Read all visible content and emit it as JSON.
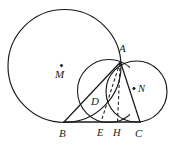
{
  "figure": {
    "background_color": "#ffffff",
    "stroke_color": "#1a1a1a",
    "width": 182,
    "height": 149,
    "labels": {
      "center_m": "M",
      "center_n": "N",
      "point_a": "A",
      "point_b": "B",
      "point_c": "C",
      "point_d": "D",
      "point_e": "E",
      "point_h": "H"
    },
    "label_positions": {
      "center_m": {
        "x": 55,
        "y": 69
      },
      "center_n": {
        "x": 138,
        "y": 84
      },
      "point_a": {
        "x": 119,
        "y": 43
      },
      "point_b": {
        "x": 59,
        "y": 128
      },
      "point_c": {
        "x": 135,
        "y": 128
      },
      "point_d": {
        "x": 91,
        "y": 96
      },
      "point_e": {
        "x": 97,
        "y": 128
      },
      "point_h": {
        "x": 113,
        "y": 128
      }
    },
    "points": {
      "A": {
        "x": 120.5,
        "y": 62.0
      },
      "B": {
        "x": 64.0,
        "y": 122.0
      },
      "C": {
        "x": 140.0,
        "y": 122.0
      },
      "D": {
        "x": 100.5,
        "y": 104.5
      },
      "E": {
        "x": 101.0,
        "y": 122.0
      },
      "H": {
        "x": 117.5,
        "y": 122.0
      },
      "M": {
        "x": 61.5,
        "y": 65.5
      },
      "N": {
        "x": 136.0,
        "y": 89.5
      }
    },
    "circles": {
      "circle_m": {
        "cx": 64.5,
        "cy": 66.0,
        "r": 56.5
      },
      "circle_n": {
        "cx": 136.5,
        "cy": 91.5,
        "r": 30.5
      },
      "circle_d": {
        "cx": 109.0,
        "cy": 91.0,
        "r": 31.5
      }
    },
    "segments": {
      "baseline_bc": {
        "x1": 63.0,
        "y1": 122.0,
        "x2": 141.0,
        "y2": 122.0
      },
      "chord_ba": {
        "x1": 64.0,
        "y1": 122.0,
        "x2": 120.5,
        "y2": 62.0
      },
      "chord_ac": {
        "x1": 120.5,
        "y1": 62.0,
        "x2": 140.0,
        "y2": 122.0
      },
      "dashed_ae": {
        "x1": 120.0,
        "y1": 62.5,
        "x2": 101.0,
        "y2": 122.0
      },
      "dashed_ah": {
        "x1": 120.2,
        "y1": 62.5,
        "x2": 117.5,
        "y2": 122.0
      }
    },
    "markers": {
      "dot_m": {
        "x": 61.5,
        "y": 65.5,
        "r": 1.1
      },
      "dot_n": {
        "x": 134.0,
        "y": 88.5,
        "r": 1.1
      }
    }
  }
}
